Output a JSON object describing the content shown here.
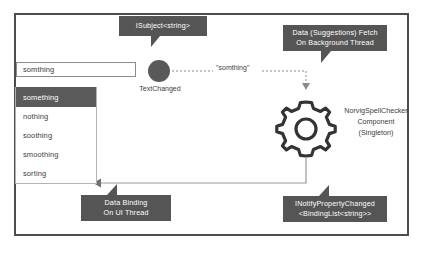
{
  "diagram": {
    "title_present": false,
    "colors": {
      "callout_fill": "#555555",
      "callout_text": "#ffffff",
      "frame_border": "#4d4d4d",
      "selected_row": "#5a5a5a",
      "node_fill": "#595959",
      "line": "#7a7a7a",
      "background": "#ffffff"
    }
  },
  "textbox": {
    "value": "somthing",
    "placeholder": "somthing"
  },
  "dropdown": {
    "items": [
      {
        "label": "something",
        "selected": true
      },
      {
        "label": "nothing",
        "selected": false
      },
      {
        "label": "soothing",
        "selected": false
      },
      {
        "label": "smoothing",
        "selected": false
      },
      {
        "label": "sorting",
        "selected": false
      }
    ]
  },
  "observable": {
    "label": "TextChanged"
  },
  "edges": {
    "text_changed_payload": "\"somthing\""
  },
  "component": {
    "name": "NorvigSpellChecker",
    "kind": "Component",
    "lifetime": "(Singleton)"
  },
  "callouts": {
    "subject": {
      "lines": [
        "ISubject<string>"
      ]
    },
    "fetch": {
      "lines": [
        "Data (Suggestions) Fetch",
        "On Background Thread"
      ]
    },
    "binding": {
      "lines": [
        "Data Binding",
        "On UI Thread"
      ]
    },
    "inpc": {
      "lines": [
        "INotifyPropertyChanged",
        "<BindingList<string>>"
      ]
    }
  }
}
